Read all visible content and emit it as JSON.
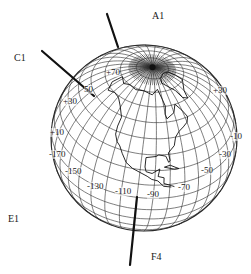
{
  "diagram": {
    "type": "orthographic-globe",
    "globe": {
      "center": [
        144,
        138
      ],
      "radius": 93,
      "pole": [
        155,
        66
      ],
      "stroke_color": "#2a2a2a",
      "fill_color": "#ffffff"
    },
    "labels": [
      {
        "id": "A1",
        "text": "A1",
        "x": 152,
        "y": 11
      },
      {
        "id": "C1",
        "text": "C1",
        "x": 14,
        "y": 53
      },
      {
        "id": "E1",
        "text": "E1",
        "x": 8,
        "y": 214
      },
      {
        "id": "F4",
        "text": "F4",
        "x": 151,
        "y": 252
      }
    ],
    "pointers": [
      {
        "id": "pointer-a1",
        "from": [
          107,
          14
        ],
        "to": [
          118,
          47
        ]
      },
      {
        "id": "pointer-c1",
        "from": [
          42,
          51
        ],
        "to": [
          94,
          96
        ]
      },
      {
        "id": "pointer-f4",
        "from": [
          130,
          265
        ],
        "to": [
          137,
          197
        ]
      }
    ],
    "degree_labels": [
      {
        "text": "+70",
        "x": 106,
        "y": 68
      },
      {
        "text": "50",
        "x": 84,
        "y": 85
      },
      {
        "text": "+30",
        "x": 63,
        "y": 97
      },
      {
        "text": "+10",
        "x": 50,
        "y": 128
      },
      {
        "text": "-170",
        "x": 49,
        "y": 150
      },
      {
        "text": "-150",
        "x": 65,
        "y": 167
      },
      {
        "text": "-130",
        "x": 87,
        "y": 182
      },
      {
        "text": "-110",
        "x": 115,
        "y": 187
      },
      {
        "text": "-90",
        "x": 147,
        "y": 190
      },
      {
        "text": "-70",
        "x": 178,
        "y": 183
      },
      {
        "text": "-50",
        "x": 201,
        "y": 166
      },
      {
        "text": "-30",
        "x": 219,
        "y": 150
      },
      {
        "text": "-10",
        "x": 230,
        "y": 132
      },
      {
        "text": "+30",
        "x": 213,
        "y": 86
      }
    ]
  }
}
